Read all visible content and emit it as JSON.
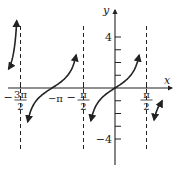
{
  "chart_data": {
    "type": "line",
    "title": "",
    "function": "y = tan x",
    "xlabel": "x",
    "ylabel": "y",
    "xlim": [
      -4.9,
      2.3
    ],
    "ylim": [
      -6.2,
      6.6
    ],
    "asymptotes": [
      -4.712389,
      -1.570796,
      1.570796
    ],
    "asymptote_labels": [
      {
        "x": -4.712389,
        "num": "3π",
        "den": "2",
        "neg": true
      },
      {
        "x": -1.570796,
        "num": "π",
        "den": "2",
        "neg": true
      },
      {
        "x": 1.570796,
        "num": "π",
        "den": "2",
        "neg": false
      }
    ],
    "x_point_labels": [
      {
        "x": -3.141593,
        "label": "−π"
      }
    ],
    "y_ticks": [
      -4,
      -3,
      -2,
      -1,
      1,
      2,
      3,
      4
    ],
    "y_tick_labels": [
      {
        "y": 4,
        "label": "4"
      },
      {
        "y": -4,
        "label": "−4"
      }
    ],
    "branches": [
      {
        "from": -5.3,
        "to": -4.9,
        "arrow_start": true,
        "arrow_end": true
      },
      {
        "from": -4.35,
        "to": -1.94
      },
      {
        "from": -1.2,
        "to": 1.2
      },
      {
        "from": 1.95,
        "to": 2.35,
        "arrow_start": true,
        "arrow_end": true
      }
    ],
    "color": "#222222"
  }
}
